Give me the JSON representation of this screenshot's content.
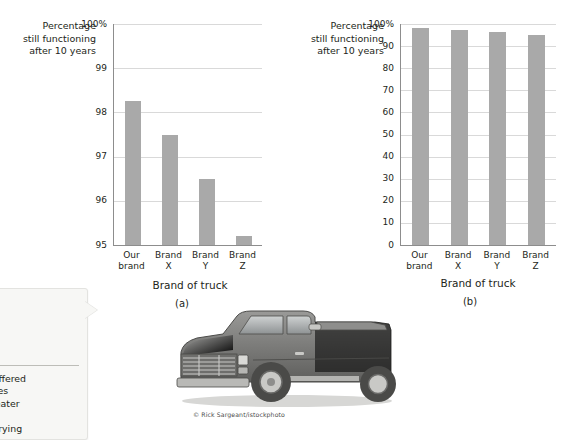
{
  "figure": {
    "credit": "© Rick Sargeant/istockphoto"
  },
  "callout": {
    "line1": "...acturer offered",
    "line2": "...and names",
    "line3": "...much greater",
    "line4": "...hat does",
    "line5": "...ut the varying"
  },
  "chart_data": [
    {
      "id": "a",
      "type": "bar",
      "title": "",
      "ylabel_lines": [
        "Percentage",
        "still functioning",
        "after 10 years"
      ],
      "xlabel": "Brand of truck",
      "caption": "(a)",
      "categories": [
        "Our brand",
        "Brand X",
        "Brand Y",
        "Brand Z"
      ],
      "category_lines": [
        [
          "Our",
          "brand"
        ],
        [
          "Brand",
          "X"
        ],
        [
          "Brand",
          "Y"
        ],
        [
          "Brand",
          "Z"
        ]
      ],
      "values": [
        98.25,
        97.5,
        96.5,
        95.2
      ],
      "ylim": [
        95,
        100
      ],
      "yticks": [
        95,
        96,
        97,
        98,
        99,
        100
      ],
      "yticklabels": [
        "95",
        "96",
        "97",
        "98",
        "99",
        "100%"
      ],
      "grid": true,
      "legend": "none",
      "bar_color": "#a9a9a9"
    },
    {
      "id": "b",
      "type": "bar",
      "title": "",
      "ylabel_lines": [
        "Percentage",
        "still functioning",
        "after 10 years"
      ],
      "xlabel": "Brand of truck",
      "caption": "(b)",
      "categories": [
        "Our brand",
        "Brand X",
        "Brand Y",
        "Brand Z"
      ],
      "category_lines": [
        [
          "Our",
          "brand"
        ],
        [
          "Brand",
          "X"
        ],
        [
          "Brand",
          "Y"
        ],
        [
          "Brand",
          "Z"
        ]
      ],
      "values": [
        98.25,
        97.5,
        96.5,
        95.2
      ],
      "ylim": [
        0,
        100
      ],
      "yticks": [
        0,
        10,
        20,
        30,
        40,
        50,
        60,
        70,
        80,
        90,
        100
      ],
      "yticklabels": [
        "0",
        "10",
        "20",
        "30",
        "40",
        "50",
        "60",
        "70",
        "80",
        "90",
        "100%"
      ],
      "grid": true,
      "legend": "none",
      "bar_color": "#a9a9a9"
    }
  ]
}
